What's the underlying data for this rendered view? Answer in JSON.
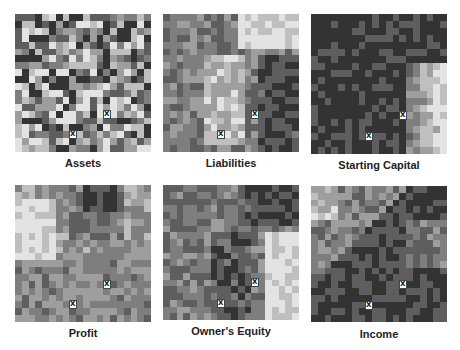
{
  "figure": {
    "grid_size": 20,
    "marker_glyph": "X",
    "palette_low": "#1e1e1e",
    "palette_high": "#f4f4f4",
    "panels": [
      {
        "title": "Assets",
        "markers": [
          [
            13,
            14
          ],
          [
            8,
            17
          ]
        ],
        "seed": 11,
        "profile": "mixed",
        "bias": 0.5
      },
      {
        "title": "Liabilities",
        "markers": [
          [
            13,
            14
          ],
          [
            8,
            17
          ]
        ],
        "seed": 23,
        "profile": "liabilities",
        "bias": 0.5
      },
      {
        "title": "Starting Capital",
        "markers": [
          [
            13,
            14
          ],
          [
            8,
            17
          ]
        ],
        "seed": 37,
        "profile": "dark_right_light",
        "bias": 0.12
      },
      {
        "title": "Profit",
        "markers": [
          [
            13,
            14
          ],
          [
            8,
            17
          ]
        ],
        "seed": 41,
        "profile": "profit",
        "bias": 0.5
      },
      {
        "title": "Owner's Equity",
        "markers": [
          [
            13,
            14
          ],
          [
            8,
            17
          ]
        ],
        "seed": 53,
        "profile": "equity",
        "bias": 0.4
      },
      {
        "title": "Income",
        "markers": [
          [
            13,
            14
          ],
          [
            8,
            17
          ]
        ],
        "seed": 67,
        "profile": "income",
        "bias": 0.3
      }
    ]
  }
}
